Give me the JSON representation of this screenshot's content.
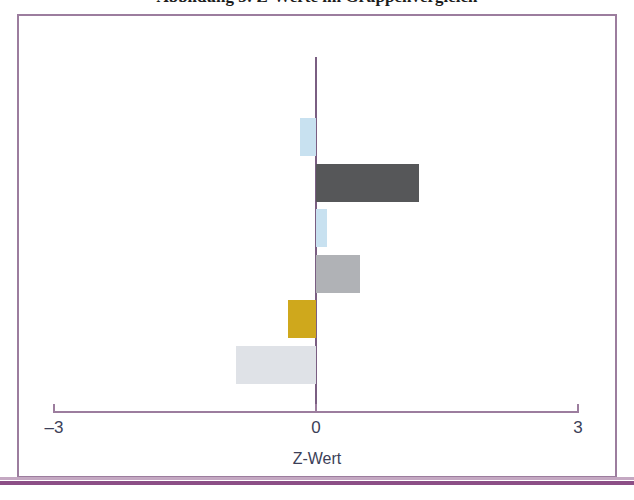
{
  "caption": {
    "text": "Abbildung 3: Z-Werte im Gruppenvergleich"
  },
  "colors": {
    "frame": "#9c7d9e",
    "frame_rule": "#8c4f86",
    "axis": "#9c7d9e",
    "zero_line": "#7a5e82",
    "tick_text": "#3c3f58",
    "light_blue": "#c8e1f0",
    "dark_gray": "#565759",
    "medium_gray": "#b0b2b6",
    "gold": "#cfa81c",
    "pale_gray": "#dfe2e7"
  },
  "chart_data": {
    "type": "bar",
    "orientation": "horizontal",
    "title": "",
    "xlabel": "Z-Wert",
    "ylabel": "",
    "xlim": [
      -3,
      3
    ],
    "xticks": [
      -3,
      0,
      3
    ],
    "xticklabels": [
      "–3",
      "0",
      "3"
    ],
    "grid": false,
    "legend": false,
    "zero_reference_line": 0,
    "categories": [
      "1",
      "2",
      "3",
      "4",
      "5",
      "6"
    ],
    "values": [
      -0.18,
      1.18,
      0.13,
      0.5,
      -0.32,
      -0.92
    ],
    "bar_colors": [
      "#c8e1f0",
      "#565759",
      "#c8e1f0",
      "#b0b2b6",
      "#cfa81c",
      "#dfe2e7"
    ],
    "bars": [
      {
        "index": 1,
        "value": -0.18,
        "color": "#c8e1f0",
        "color_name": "light-blue"
      },
      {
        "index": 2,
        "value": 1.18,
        "color": "#565759",
        "color_name": "dark-gray"
      },
      {
        "index": 3,
        "value": 0.13,
        "color": "#c8e1f0",
        "color_name": "light-blue"
      },
      {
        "index": 4,
        "value": 0.5,
        "color": "#b0b2b6",
        "color_name": "medium-gray"
      },
      {
        "index": 5,
        "value": -0.32,
        "color": "#cfa81c",
        "color_name": "gold"
      },
      {
        "index": 6,
        "value": -0.92,
        "color": "#dfe2e7",
        "color_name": "pale-gray"
      }
    ]
  },
  "axis": {
    "label": "Z-Wert",
    "tick_left": "–3",
    "tick_center": "0",
    "tick_right": "3"
  }
}
